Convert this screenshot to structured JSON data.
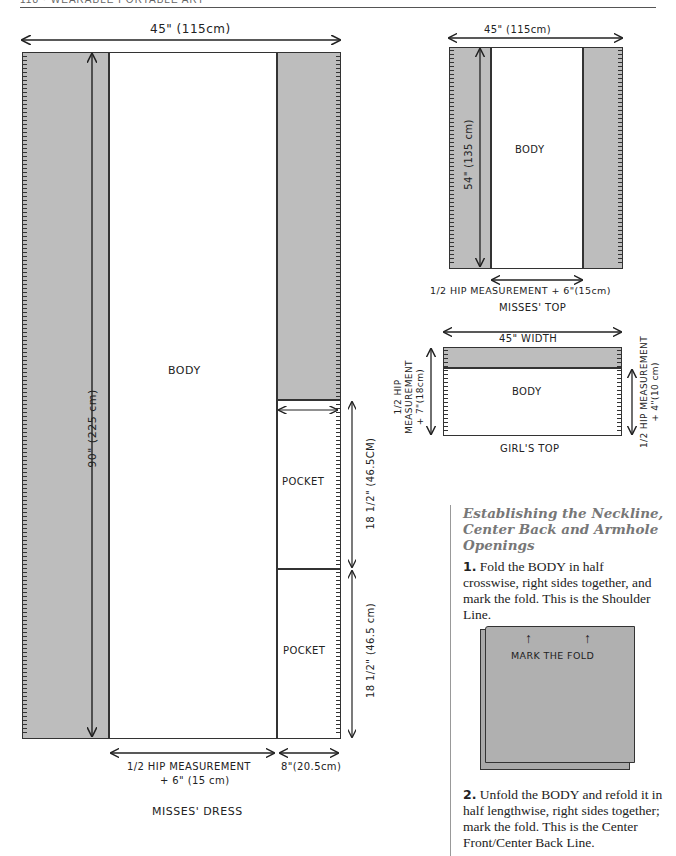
{
  "header": {
    "running_title": "118 · WEARABLE PORTABLE ART"
  },
  "misses_dress": {
    "caption": "MISSES' DRESS",
    "width_label": "45\" (115cm)",
    "length_label": "90\" (225 cm)",
    "body_label": "BODY",
    "pockets": [
      {
        "label": "POCKET",
        "dimension": "18 1/2\" (46.5CM)"
      },
      {
        "label": "POCKET",
        "dimension": "18 1/2\" (46.5 cm)"
      }
    ],
    "bottom_label_line1": "1/2 HIP MEASUREMENT",
    "bottom_label_line2": "+ 6\" (15 cm)",
    "pocket_width_label": "8\"(20.5cm)"
  },
  "misses_top": {
    "caption": "MISSES' TOP",
    "width_label": "45\" (115cm)",
    "length_label": "54\" (135 cm)",
    "body_label": "BODY",
    "bottom_label": "1/2 HIP MEASUREMENT + 6\"(15cm)"
  },
  "girls_top": {
    "caption": "GIRL'S TOP",
    "width_label": "45\" WIDTH",
    "body_label": "BODY",
    "left_label_line1": "1/2 HIP",
    "left_label_line2": "MEASUREMENT",
    "left_label_line3": "+ 7\"(18cm)",
    "right_label_line1": "1/2 HIP MEASUREMENT",
    "right_label_line2": "+ 4\"(10 cm)"
  },
  "instructions": {
    "heading": "Establishing the Neckline, Center Back and Armhole Openings",
    "steps": [
      {
        "num": "1.",
        "text": "Fold the BODY in half crosswise, right sides together, and mark the fold. This is the Shoulder Line."
      },
      {
        "num": "2.",
        "text": "Unfold the BODY and refold it in half lengthwise, right sides together; mark the fold. This is the Center Front/Center Back Line."
      }
    ],
    "fold_illustration_label": "MARK THE FOLD"
  },
  "colors": {
    "fabric_gray": "#bdbdbd",
    "line": "#333333",
    "heading_gray": "#777777"
  }
}
